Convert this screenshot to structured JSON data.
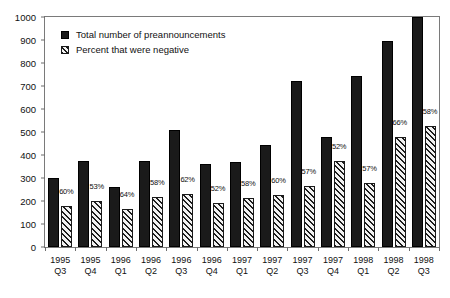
{
  "chart_data": {
    "type": "bar",
    "title": "",
    "xlabel": "",
    "ylabel": "",
    "ylim": [
      0,
      1000
    ],
    "ytick_step": 100,
    "yticks": [
      "0",
      "100",
      "200",
      "300",
      "400",
      "500",
      "600",
      "700",
      "800",
      "900",
      "1000"
    ],
    "grid": false,
    "legend_position": "top-left",
    "categories": [
      "1995 Q3",
      "1995 Q4",
      "1996 Q1",
      "1996 Q2",
      "1996 Q3",
      "1996 Q4",
      "1997 Q1",
      "1997 Q2",
      "1997 Q3",
      "1997 Q4",
      "1998 Q1",
      "1998 Q2",
      "1998 Q3"
    ],
    "category_lines": [
      {
        "year": "1995",
        "quarter": "Q3"
      },
      {
        "year": "1995",
        "quarter": "Q4"
      },
      {
        "year": "1996",
        "quarter": "Q1"
      },
      {
        "year": "1996",
        "quarter": "Q2"
      },
      {
        "year": "1996",
        "quarter": "Q3"
      },
      {
        "year": "1996",
        "quarter": "Q4"
      },
      {
        "year": "1997",
        "quarter": "Q1"
      },
      {
        "year": "1997",
        "quarter": "Q2"
      },
      {
        "year": "1997",
        "quarter": "Q3"
      },
      {
        "year": "1997",
        "quarter": "Q4"
      },
      {
        "year": "1998",
        "quarter": "Q1"
      },
      {
        "year": "1998",
        "quarter": "Q2"
      },
      {
        "year": "1998",
        "quarter": "Q3"
      }
    ],
    "series": [
      {
        "name": "Total number of preannouncements",
        "key": "total",
        "style": "solid-black",
        "values": [
          300,
          375,
          260,
          375,
          510,
          360,
          370,
          445,
          720,
          480,
          745,
          895,
          1000
        ]
      },
      {
        "name": "Percent that were negative",
        "key": "percent",
        "style": "diagonal-hatch",
        "unit": "%",
        "values": [
          60,
          53,
          64,
          58,
          62,
          52,
          58,
          60,
          57,
          52,
          57,
          66,
          58
        ],
        "data_labels": [
          "60%",
          "53%",
          "64%",
          "58%",
          "62%",
          "52%",
          "58%",
          "60%",
          "57%",
          "52%",
          "57%",
          "66%",
          "58%"
        ],
        "bar_heights_in_total_scale": [
          180,
          198,
          166,
          218,
          232,
          190,
          215,
          228,
          267,
          375,
          278,
          480,
          525
        ]
      }
    ],
    "legend": [
      {
        "label": "Total number of preannouncements",
        "swatch": "solid-black"
      },
      {
        "label": "Percent that were negative",
        "swatch": "diagonal-hatch"
      }
    ],
    "colors": {
      "bar_total": "#1a1a1a",
      "bar_percent_hatch": "#1d1d1d",
      "bar_percent_fill": "#f2f2f2",
      "axis": "#6d6d6d",
      "text": "#111111",
      "background": "#ffffff"
    }
  }
}
